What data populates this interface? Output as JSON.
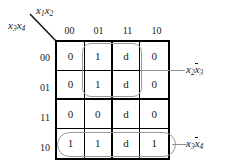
{
  "figure": {
    "type": "karnaugh-map",
    "column_variables": {
      "base1": "x",
      "sub1": "1",
      "base2": "x",
      "sub2": "2"
    },
    "row_variables": {
      "base1": "x",
      "sub1": "3",
      "base2": "x",
      "sub2": "4"
    },
    "column_headers": [
      "00",
      "01",
      "11",
      "10"
    ],
    "row_headers": [
      "00",
      "01",
      "11",
      "10"
    ],
    "cells": [
      [
        "0",
        "1",
        "d",
        "0"
      ],
      [
        "0",
        "1",
        "d",
        "0"
      ],
      [
        "0",
        "0",
        "d",
        "0"
      ],
      [
        "1",
        "1",
        "d",
        "1"
      ]
    ],
    "groups": [
      {
        "id": "x2nx3",
        "label_parts": [
          {
            "base": "x",
            "sub": "2",
            "bar": false
          },
          {
            "base": "x",
            "sub": "3",
            "bar": true
          }
        ],
        "covers_rows": [
          "00",
          "01"
        ],
        "covers_columns": [
          "01",
          "11"
        ]
      },
      {
        "id": "x3nx4",
        "label_parts": [
          {
            "base": "x",
            "sub": "3",
            "bar": false
          },
          {
            "base": "x",
            "sub": "4",
            "bar": true
          }
        ],
        "covers_rows": [
          "10"
        ],
        "covers_columns": [
          "00",
          "01",
          "11",
          "10"
        ]
      }
    ],
    "colors": {
      "grid_line": "#000000",
      "group_loop": "#9a9a9a",
      "leader_line": "#8f8f8f",
      "text": "#1a1a1a",
      "background": "#ffffff"
    }
  }
}
